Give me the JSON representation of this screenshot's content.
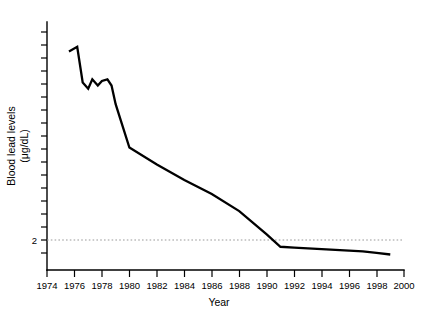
{
  "chart_data": {
    "type": "line",
    "title": "",
    "xlabel": "Year",
    "ylabel": "Blood lead levels (μg/dL)",
    "ylabel_line1": "Blood lead levels",
    "ylabel_line2": "(μg/dL)",
    "xlim": [
      1974,
      2000
    ],
    "ylim": [
      1.0,
      17.0
    ],
    "grid": false,
    "legend": null,
    "x_tick_labels": [
      "1974",
      "1976",
      "1978",
      "1980",
      "1982",
      "1984",
      "1986",
      "1988",
      "1990",
      "1992",
      "1994",
      "1996",
      "1998",
      "2000"
    ],
    "x_ticks": [
      1974,
      1976,
      1978,
      1980,
      1982,
      1984,
      1986,
      1988,
      1990,
      1992,
      1994,
      1996,
      1998,
      2000
    ],
    "y_tick_labels": [
      "",
      "2",
      "",
      "",
      "",
      "",
      "",
      "",
      "",
      "",
      "",
      ""
    ],
    "y_ticks": [
      1,
      2,
      3,
      4,
      5,
      6,
      7,
      8,
      9,
      10,
      11,
      12,
      13,
      14,
      15,
      16
    ],
    "y_labeled_ticks": [
      {
        "value": 2,
        "label": "2"
      }
    ],
    "annotations": [
      {
        "type": "reference-line",
        "name": "level-2-dotted-line",
        "y": 2,
        "style": "dotted",
        "color": "#9a9a9a"
      }
    ],
    "series": [
      {
        "name": "Blood lead level",
        "color": "#000000",
        "x": [
          1975.6,
          1976.2,
          1976.6,
          1977.0,
          1977.3,
          1977.7,
          1978.0,
          1978.4,
          1978.7,
          1979.0,
          1979.5,
          1980.0,
          1982.0,
          1984.0,
          1986.0,
          1988.0,
          1990.0,
          1991.0,
          1992.0,
          1993.0,
          1994.0,
          1995.0,
          1996.0,
          1997.0,
          1998.0,
          1999.0
        ],
        "values": [
          15.1,
          15.4,
          13.1,
          12.7,
          13.3,
          12.9,
          13.2,
          13.3,
          12.9,
          11.7,
          10.3,
          8.9,
          7.8,
          6.8,
          5.9,
          4.8,
          3.3,
          2.5,
          2.45,
          2.4,
          2.35,
          2.3,
          2.25,
          2.2,
          2.1,
          2.0
        ]
      }
    ]
  },
  "figure": {
    "x_axis_name": "x-axis",
    "y_axis_name": "y-axis"
  }
}
